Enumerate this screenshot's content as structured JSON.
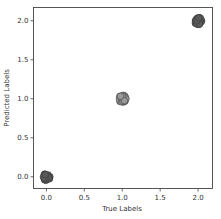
{
  "chart_data": {
    "type": "scatter",
    "title": "",
    "xlabel": "True Labels",
    "ylabel": "Predicted Labels",
    "xlim": [
      -0.17,
      2.19
    ],
    "ylim": [
      -0.15,
      2.17
    ],
    "grid": false,
    "legend": "none",
    "xticks": [
      0.0,
      0.5,
      1.0,
      1.5,
      2.0
    ],
    "xtick_labels": [
      "0.0",
      "0.5",
      "1.0",
      "1.5",
      "2.0"
    ],
    "yticks": [
      0.0,
      0.5,
      1.0,
      1.5,
      2.0
    ],
    "ytick_labels": [
      "0.0",
      "0.5",
      "1.0",
      "1.5",
      "2.0"
    ],
    "clusters": [
      {
        "true": 0,
        "predicted": 0,
        "color": "#5a5a5a",
        "jitter": 0.05
      },
      {
        "true": 1,
        "predicted": 1,
        "color": "#9a9a9a",
        "jitter": 0.05
      },
      {
        "true": 2,
        "predicted": 2,
        "color": "#5a5a5a",
        "jitter": 0.05
      }
    ],
    "edge_color": "#3a3a3a"
  }
}
